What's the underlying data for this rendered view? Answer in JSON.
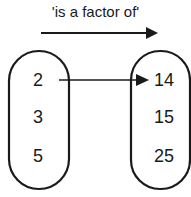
{
  "diagram": {
    "relation_label": "'is a factor of'",
    "left_set": [
      "2",
      "3",
      "5"
    ],
    "right_set": [
      "14",
      "15",
      "25"
    ],
    "mappings": [
      {
        "from": "2",
        "to": "14"
      }
    ],
    "colors": {
      "ink": "#1a1a1a",
      "background": "#ffffff"
    }
  }
}
